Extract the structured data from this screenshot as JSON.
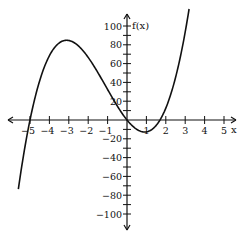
{
  "chart_data": {
    "type": "line",
    "title": "",
    "xlabel": "x",
    "ylabel": "f(x)",
    "xlim": [
      -6,
      5.6
    ],
    "ylim": [
      -110,
      110
    ],
    "x_ticks": [
      -5,
      -4,
      -3,
      -2,
      -1,
      1,
      2,
      3,
      4,
      5
    ],
    "y_ticks": [
      -100,
      -80,
      -60,
      -40,
      -20,
      20,
      40,
      60,
      80,
      100
    ],
    "x_minor_step": 1,
    "y_minor_step": 10,
    "grid": false,
    "series": [
      {
        "name": "f(x)",
        "function": "3*x*(x+5)*(x-1.7)",
        "x_range": [
          -5.6,
          3.2
        ],
        "key_points": [
          {
            "x": -5,
            "y": 0
          },
          {
            "x": -3,
            "y": 86
          },
          {
            "x": 0,
            "y": 0
          },
          {
            "x": 1,
            "y": -12
          },
          {
            "x": 1.7,
            "y": 0
          },
          {
            "x": 3.2,
            "y": 108
          }
        ],
        "color": "#111111"
      }
    ]
  },
  "axis": {
    "x_label": "x",
    "y_label": "f(x)"
  },
  "layout": {
    "origin_px": [
      127,
      120
    ],
    "x_unit_px": 19.4,
    "y_unit_px": 0.94
  }
}
